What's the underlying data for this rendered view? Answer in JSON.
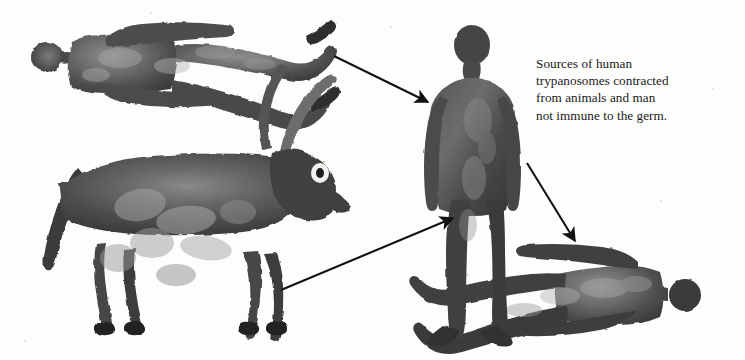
{
  "figure": {
    "background_color": "#fdfdfc",
    "ink_color": "#3c3c3c",
    "arrow_color": "#111111"
  },
  "caption": {
    "lines": [
      "Sources of human",
      "trypanosomes contracted",
      "from animals and man",
      "not immune to the germ."
    ],
    "full_text": "Sources of human trypanosomes contracted from animals and man not immune to the germ."
  },
  "figures": [
    {
      "id": "reclining-human-top-left",
      "label": "Human figure lying horizontally, head at left",
      "role": "source-human",
      "x": 33,
      "y": 18,
      "width": 305,
      "height": 92
    },
    {
      "id": "cow-left",
      "label": "Long-horned cow or ox facing right",
      "role": "source-animal",
      "x": 42,
      "y": 108,
      "width": 300,
      "height": 228
    },
    {
      "id": "standing-human-center",
      "label": "Standing human figure, arms at sides",
      "role": "recipient-human",
      "x": 410,
      "y": 26,
      "width": 110,
      "height": 320
    },
    {
      "id": "reclining-human-bottom-right",
      "label": "Human figure lying horizontally, head at right",
      "role": "infected-human",
      "x": 412,
      "y": 240,
      "width": 290,
      "height": 110
    }
  ],
  "arrows": [
    {
      "id": "arrow-human-to-center",
      "from_figure": "reclining-human-top-left",
      "to_figure": "standing-human-center",
      "x1": 334,
      "y1": 56,
      "x2": 430,
      "y2": 103,
      "direction": "down-right"
    },
    {
      "id": "arrow-cow-to-center",
      "from_figure": "cow-left",
      "to_figure": "standing-human-center",
      "x1": 281,
      "y1": 290,
      "x2": 455,
      "y2": 217,
      "direction": "up-right"
    },
    {
      "id": "arrow-center-to-human",
      "from_figure": "standing-human-center",
      "to_figure": "reclining-human-bottom-right",
      "x1": 527,
      "y1": 163,
      "x2": 577,
      "y2": 243,
      "direction": "down-right"
    }
  ]
}
